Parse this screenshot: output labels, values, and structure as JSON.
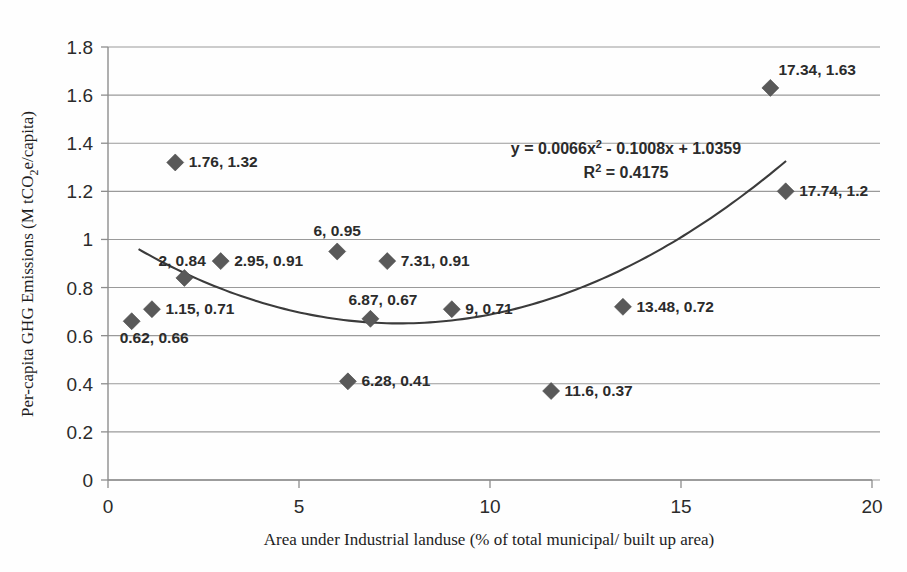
{
  "chart_data": {
    "type": "scatter",
    "title": "",
    "xlabel": "Area under Industrial landuse (% of total municipal/ built up area)",
    "ylabel": "Per-capita GHG Emissions (M tCO2e/capita)",
    "ylabel_parts": {
      "before": "Per-capita GHG Emissions (M tCO",
      "subscript": "2",
      "after": "e/capita)"
    },
    "xlim": [
      0,
      20
    ],
    "ylim": [
      0,
      1.8
    ],
    "xticks": [
      "0",
      "5",
      "10",
      "15",
      "20"
    ],
    "xtick_values": [
      0,
      5,
      10,
      15,
      20
    ],
    "yticks": [
      "0",
      "0.2",
      "0.4",
      "0.6",
      "0.8",
      "1",
      "1.2",
      "1.4",
      "1.6",
      "1.8"
    ],
    "ytick_values": [
      0,
      0.2,
      0.4,
      0.6,
      0.8,
      1,
      1.2,
      1.4,
      1.6,
      1.8
    ],
    "grid": "horizontal",
    "legend": "none",
    "marker_shape": "diamond",
    "marker_color": "#595959",
    "trendline_color": "#3b3b3b",
    "points": [
      {
        "x": 0.62,
        "y": 0.66,
        "label": "0.62, 0.66",
        "label_pos": "below-right"
      },
      {
        "x": 1.15,
        "y": 0.71,
        "label": "1.15, 0.71",
        "label_pos": "right"
      },
      {
        "x": 1.76,
        "y": 1.32,
        "label": "1.76, 1.32",
        "label_pos": "right"
      },
      {
        "x": 2.0,
        "y": 0.84,
        "label": "2, 0.84",
        "label_pos": "above-right"
      },
      {
        "x": 2.95,
        "y": 0.91,
        "label": "2.95, 0.91",
        "label_pos": "right"
      },
      {
        "x": 6.0,
        "y": 0.95,
        "label": "6, 0.95",
        "label_pos": "above"
      },
      {
        "x": 6.28,
        "y": 0.41,
        "label": "6.28, 0.41",
        "label_pos": "right"
      },
      {
        "x": 6.87,
        "y": 0.67,
        "label": "6.87, 0.67",
        "label_pos": "above-right"
      },
      {
        "x": 7.31,
        "y": 0.91,
        "label": "7.31, 0.91",
        "label_pos": "right"
      },
      {
        "x": 9.0,
        "y": 0.71,
        "label": "9, 0.71",
        "label_pos": "right"
      },
      {
        "x": 11.6,
        "y": 0.37,
        "label": "11.6, 0.37",
        "label_pos": "right"
      },
      {
        "x": 13.48,
        "y": 0.72,
        "label": "13.48, 0.72",
        "label_pos": "right"
      },
      {
        "x": 17.34,
        "y": 1.63,
        "label": "17.34, 1.63",
        "label_pos": "above-right"
      },
      {
        "x": 17.74,
        "y": 1.2,
        "label": "17.74, 1.2",
        "label_pos": "right"
      }
    ],
    "trendline": {
      "type": "polynomial",
      "degree": 2,
      "coefficients": {
        "a": 0.0066,
        "b": -0.1008,
        "c": 1.0359
      },
      "x_range": [
        0.8,
        17.75
      ],
      "equation_line1": "y = 0.0066x",
      "equation_exponent": "2",
      "equation_line1_rest": " - 0.1008x + 1.0359",
      "equation_full": "y = 0.0066x² - 0.1008x + 1.0359",
      "r_squared_label": "R",
      "r_squared_exponent": "2",
      "r_squared_value": " = 0.4175",
      "r_squared_full": "R² = 0.4175"
    }
  }
}
